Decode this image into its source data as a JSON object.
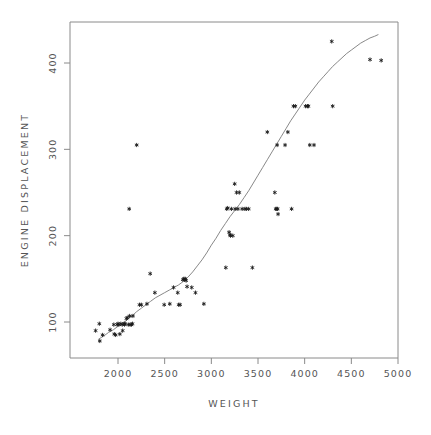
{
  "chart_data": {
    "type": "scatter",
    "title": "",
    "xlabel": "WEIGHT",
    "ylabel": "ENGINE DISPLACEMENT",
    "xlim": [
      1700,
      5000
    ],
    "ylim": [
      55,
      440
    ],
    "xticks": [
      2000,
      2500,
      3000,
      3500,
      4000,
      4500,
      5000
    ],
    "xtick_labels": [
      "2000",
      "2500",
      "3000",
      "3500",
      "4000",
      "4500",
      "5000"
    ],
    "yticks": [
      100,
      200,
      300,
      400
    ],
    "ytick_labels": [
      "100",
      "200",
      "300",
      "400"
    ],
    "grid": false,
    "legend": null,
    "marker": "asterisk",
    "marker_color": "#1a1a1a",
    "frame_color": "#8a8a8a",
    "fit_line_color": "#7a7a7a",
    "fit_line_label": "smoothed fit curve",
    "points": [
      [
        1760,
        90
      ],
      [
        1800,
        98
      ],
      [
        1805,
        78
      ],
      [
        1835,
        85
      ],
      [
        1915,
        91
      ],
      [
        1955,
        97
      ],
      [
        1960,
        86
      ],
      [
        1975,
        85
      ],
      [
        1990,
        97
      ],
      [
        2000,
        98
      ],
      [
        2010,
        97
      ],
      [
        2020,
        86
      ],
      [
        2030,
        98
      ],
      [
        2045,
        97
      ],
      [
        2050,
        90
      ],
      [
        2065,
        98
      ],
      [
        2070,
        97
      ],
      [
        2075,
        98
      ],
      [
        2090,
        104
      ],
      [
        2100,
        105
      ],
      [
        2110,
        97
      ],
      [
        2120,
        231
      ],
      [
        2125,
        107
      ],
      [
        2130,
        97
      ],
      [
        2145,
        97
      ],
      [
        2155,
        98
      ],
      [
        2160,
        107
      ],
      [
        2200,
        305
      ],
      [
        2230,
        120
      ],
      [
        2250,
        120
      ],
      [
        2310,
        121
      ],
      [
        2345,
        156
      ],
      [
        2395,
        134
      ],
      [
        2495,
        120
      ],
      [
        2555,
        121
      ],
      [
        2595,
        140
      ],
      [
        2640,
        134
      ],
      [
        2650,
        120
      ],
      [
        2665,
        120
      ],
      [
        2695,
        149
      ],
      [
        2705,
        150
      ],
      [
        2715,
        149
      ],
      [
        2720,
        150
      ],
      [
        2730,
        148
      ],
      [
        2740,
        141
      ],
      [
        2790,
        140
      ],
      [
        2830,
        134
      ],
      [
        2920,
        121
      ],
      [
        3155,
        163
      ],
      [
        3165,
        231
      ],
      [
        3175,
        232
      ],
      [
        3190,
        204
      ],
      [
        3200,
        201
      ],
      [
        3205,
        200
      ],
      [
        3215,
        231
      ],
      [
        3230,
        200
      ],
      [
        3250,
        260
      ],
      [
        3255,
        231
      ],
      [
        3270,
        250
      ],
      [
        3285,
        231
      ],
      [
        3300,
        250
      ],
      [
        3330,
        231
      ],
      [
        3360,
        231
      ],
      [
        3375,
        231
      ],
      [
        3400,
        231
      ],
      [
        3440,
        163
      ],
      [
        3600,
        320
      ],
      [
        3680,
        250
      ],
      [
        3690,
        231
      ],
      [
        3700,
        231
      ],
      [
        3705,
        305
      ],
      [
        3710,
        231
      ],
      [
        3715,
        225
      ],
      [
        3790,
        305
      ],
      [
        3820,
        320
      ],
      [
        3860,
        231
      ],
      [
        3880,
        350
      ],
      [
        3900,
        350
      ],
      [
        4010,
        350
      ],
      [
        4030,
        350
      ],
      [
        4040,
        350
      ],
      [
        4055,
        305
      ],
      [
        4100,
        305
      ],
      [
        4290,
        425
      ],
      [
        4300,
        350
      ],
      [
        4700,
        404
      ],
      [
        4820,
        403
      ]
    ],
    "fit_curve": [
      [
        1790,
        80
      ],
      [
        1850,
        84
      ],
      [
        1900,
        88
      ],
      [
        1950,
        91
      ],
      [
        2000,
        95
      ],
      [
        2050,
        98
      ],
      [
        2100,
        103
      ],
      [
        2150,
        107
      ],
      [
        2200,
        112
      ],
      [
        2250,
        116
      ],
      [
        2300,
        120
      ],
      [
        2350,
        124
      ],
      [
        2400,
        128
      ],
      [
        2450,
        131
      ],
      [
        2500,
        134
      ],
      [
        2550,
        137
      ],
      [
        2600,
        140
      ],
      [
        2650,
        143
      ],
      [
        2700,
        147
      ],
      [
        2750,
        152
      ],
      [
        2800,
        158
      ],
      [
        2850,
        165
      ],
      [
        2900,
        172
      ],
      [
        2950,
        180
      ],
      [
        3000,
        189
      ],
      [
        3050,
        197
      ],
      [
        3100,
        206
      ],
      [
        3150,
        214
      ],
      [
        3200,
        222
      ],
      [
        3250,
        229
      ],
      [
        3300,
        236
      ],
      [
        3350,
        244
      ],
      [
        3400,
        252
      ],
      [
        3450,
        261
      ],
      [
        3500,
        270
      ],
      [
        3550,
        279
      ],
      [
        3600,
        288
      ],
      [
        3650,
        297
      ],
      [
        3700,
        306
      ],
      [
        3750,
        315
      ],
      [
        3800,
        324
      ],
      [
        3850,
        333
      ],
      [
        3900,
        341
      ],
      [
        3950,
        349
      ],
      [
        4000,
        357
      ],
      [
        4050,
        364
      ],
      [
        4100,
        371
      ],
      [
        4150,
        378
      ],
      [
        4200,
        384
      ],
      [
        4250,
        390
      ],
      [
        4300,
        396
      ],
      [
        4350,
        401
      ],
      [
        4400,
        406
      ],
      [
        4450,
        411
      ],
      [
        4500,
        415
      ],
      [
        4550,
        419
      ],
      [
        4600,
        423
      ],
      [
        4650,
        426
      ],
      [
        4700,
        429
      ],
      [
        4750,
        431
      ],
      [
        4790,
        433
      ]
    ]
  }
}
